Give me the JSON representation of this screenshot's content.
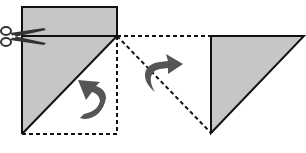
{
  "diagram": {
    "colors": {
      "paper_fill": "#c6c6c6",
      "outline": "#111111",
      "arrow": "#555555",
      "background": "#ffffff"
    },
    "steps": [
      {
        "name": "cut",
        "icon": "scissors-icon"
      },
      {
        "name": "fold-diagonal",
        "icon": "curved-arrow-up-left-icon"
      },
      {
        "name": "flip-right",
        "icon": "curved-arrow-right-icon"
      }
    ]
  }
}
